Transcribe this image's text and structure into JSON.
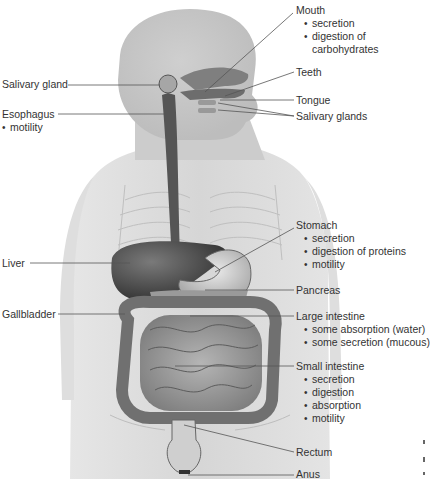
{
  "diagram": {
    "labels": {
      "mouth": {
        "title": "Mouth",
        "functions": [
          "secretion",
          "digestion of",
          "carbohydrates"
        ]
      },
      "teeth": {
        "title": "Teeth"
      },
      "tongue": {
        "title": "Tongue"
      },
      "salivary_glands": {
        "title": "Salivary glands"
      },
      "salivary_gland": {
        "title": "Salivary gland"
      },
      "esophagus": {
        "title": "Esophagus",
        "functions": [
          "motility"
        ]
      },
      "stomach": {
        "title": "Stomach",
        "functions": [
          "secretion",
          "digestion of proteins",
          "motility"
        ]
      },
      "liver": {
        "title": "Liver"
      },
      "pancreas": {
        "title": "Pancreas"
      },
      "gallbladder": {
        "title": "Gallbladder"
      },
      "large_intestine": {
        "title": "Large intestine",
        "functions": [
          "some absorption (water)",
          "some secretion (mucous)"
        ]
      },
      "small_intestine": {
        "title": "Small intestine",
        "functions": [
          "secretion",
          "digestion",
          "absorption",
          "motility"
        ]
      },
      "rectum": {
        "title": "Rectum"
      },
      "anus": {
        "title": "Anus"
      }
    },
    "colors": {
      "body_fill": "#d9d9d9",
      "body_light": "#e8e8e8",
      "organ_dark": "#4a4a4a",
      "organ_mid": "#8c8c8c",
      "leader_line": "#555555",
      "text": "#333333"
    }
  }
}
